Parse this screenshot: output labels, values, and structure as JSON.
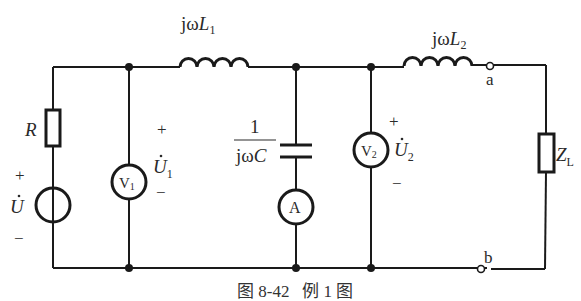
{
  "diagram": {
    "type": "circuit",
    "caption": "图 8-42   例 1 图",
    "labels": {
      "inductor1": {
        "prefix": "jω",
        "var": "L",
        "sub": "1"
      },
      "inductor2": {
        "prefix": "jω",
        "var": "L",
        "sub": "2"
      },
      "resistor": "R",
      "source_voltage": {
        "var": "U",
        "plus": "+",
        "minus": "−"
      },
      "voltmeter1": {
        "name": "V",
        "sub": "1"
      },
      "voltmeter1_voltage": {
        "var": "U",
        "sub": "1",
        "plus": "+",
        "minus": "−"
      },
      "capacitor": {
        "numerator": "1",
        "denominator_prefix": "jω",
        "denominator_var": "C"
      },
      "ammeter": "A",
      "voltmeter2": {
        "name": "V",
        "sub": "2"
      },
      "voltmeter2_voltage": {
        "var": "U",
        "sub": "2",
        "plus": "+",
        "minus": "−"
      },
      "load": {
        "var": "Z",
        "sub": "L"
      },
      "terminal_a": "a",
      "terminal_b": "b"
    }
  }
}
